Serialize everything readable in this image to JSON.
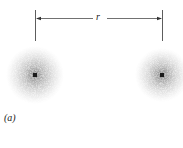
{
  "diagram": {
    "distance_label": "r",
    "panel_label": "(a)",
    "atoms": [
      {
        "name": "left-atom",
        "cx": 35,
        "cy": 75,
        "radius": 29
      },
      {
        "name": "right-atom",
        "cx": 162,
        "cy": 75,
        "radius": 27
      }
    ],
    "colors": {
      "ink": "#222222",
      "cloud": "#555555",
      "nucleus": "#1a1a1a"
    }
  }
}
